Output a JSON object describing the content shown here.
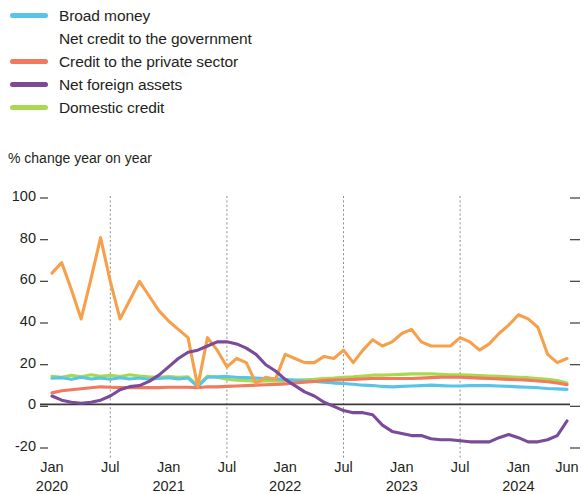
{
  "legend": {
    "items": [
      {
        "label": "Broad money",
        "color": "#58c4e8",
        "key": "broad_money"
      },
      {
        "label": "Net credit to the government",
        "color": "#f6a košt",
        "key": "net_credit_gov"
      },
      {
        "label": "Credit to the private sector",
        "color": "#f0795e",
        "key": "credit_private"
      },
      {
        "label": "Net foreign assets",
        "color": "#7b4a99",
        "key": "net_foreign_assets"
      },
      {
        "label": "Domestic credit",
        "color": "#a9d94e",
        "key": "domestic_credit"
      }
    ]
  },
  "axis_title": "% change year on year",
  "chart_data": {
    "type": "line",
    "title": "",
    "subtitle": "",
    "xlabel": "",
    "ylabel": "% change year on year",
    "ylim": [
      -20,
      100
    ],
    "yticks": [
      100,
      80,
      60,
      40,
      20,
      0,
      -20
    ],
    "ytick_labels": [
      "100",
      "80",
      "60",
      "40",
      "20",
      "0",
      "-20"
    ],
    "grid": "vertical-dashed-at-july",
    "legend_position": "above-plot-left",
    "zero_line": 0,
    "x_start": "2020-01",
    "x_end": "2024-06",
    "x_tick_labels": [
      {
        "month": "Jan",
        "year": "2020",
        "index": 0
      },
      {
        "month": "Jul",
        "year": "",
        "index": 6
      },
      {
        "month": "Jan",
        "year": "2021",
        "index": 12
      },
      {
        "month": "Jul",
        "year": "",
        "index": 18
      },
      {
        "month": "Jan",
        "year": "2022",
        "index": 24
      },
      {
        "month": "Jul",
        "year": "",
        "index": 30
      },
      {
        "month": "Jan",
        "year": "2023",
        "index": 36
      },
      {
        "month": "Jul",
        "year": "",
        "index": 42
      },
      {
        "month": "Jan",
        "year": "2024",
        "index": 48
      },
      {
        "month": "Jun",
        "year": "",
        "index": 53
      }
    ],
    "gridline_indices": [
      6,
      18,
      30,
      42
    ],
    "x_months": [
      "2020-01",
      "2020-02",
      "2020-03",
      "2020-04",
      "2020-05",
      "2020-06",
      "2020-07",
      "2020-08",
      "2020-09",
      "2020-10",
      "2020-11",
      "2020-12",
      "2021-01",
      "2021-02",
      "2021-03",
      "2021-04",
      "2021-05",
      "2021-06",
      "2021-07",
      "2021-08",
      "2021-09",
      "2021-10",
      "2021-11",
      "2021-12",
      "2022-01",
      "2022-02",
      "2022-03",
      "2022-04",
      "2022-05",
      "2022-06",
      "2022-07",
      "2022-08",
      "2022-09",
      "2022-10",
      "2022-11",
      "2022-12",
      "2023-01",
      "2023-02",
      "2023-03",
      "2023-04",
      "2023-05",
      "2023-06",
      "2023-07",
      "2023-08",
      "2023-09",
      "2023-10",
      "2023-11",
      "2023-12",
      "2024-01",
      "2024-02",
      "2024-03",
      "2024-04",
      "2024-05",
      "2024-06"
    ],
    "series": [
      {
        "name": "Broad money",
        "color": "#58c4e8",
        "values": [
          12.5,
          12.8,
          12.0,
          13.0,
          12.2,
          12.6,
          12.0,
          12.8,
          12.2,
          12.6,
          12.0,
          12.4,
          12.8,
          12.2,
          12.6,
          8.5,
          13.0,
          13.2,
          13.4,
          13.0,
          12.8,
          12.6,
          12.4,
          12.2,
          12.0,
          11.6,
          11.2,
          11.0,
          10.6,
          10.2,
          10.0,
          9.6,
          9.2,
          9.0,
          8.6,
          8.4,
          8.6,
          8.8,
          9.0,
          9.2,
          9.0,
          8.8,
          8.8,
          9.0,
          9.0,
          9.0,
          8.8,
          8.6,
          8.4,
          8.2,
          8.0,
          7.6,
          7.4,
          7.2
        ]
      },
      {
        "name": "Net credit to the government",
        "color": "#f6a04b",
        "values": [
          63.0,
          68.0,
          55.0,
          41.0,
          60.0,
          80.0,
          59.0,
          41.0,
          50.0,
          59.0,
          52.0,
          45.0,
          40.0,
          36.0,
          32.0,
          8.5,
          32.0,
          26.0,
          18.0,
          22.0,
          20.0,
          10.0,
          13.0,
          12.0,
          24.0,
          22.0,
          20.0,
          20.0,
          23.0,
          22.0,
          26.0,
          20.0,
          26.0,
          31.0,
          28.0,
          30.0,
          34.0,
          36.0,
          30.0,
          28.0,
          28.0,
          28.0,
          32.0,
          30.0,
          26.0,
          29.0,
          34.0,
          38.0,
          43.0,
          41.0,
          37.0,
          24.0,
          20.0,
          22.0
        ]
      },
      {
        "name": "Credit to the private sector",
        "color": "#f0795e",
        "values": [
          5.5,
          6.5,
          7.0,
          7.5,
          8.0,
          8.4,
          8.2,
          8.0,
          8.0,
          8.0,
          8.0,
          8.0,
          8.2,
          8.2,
          8.2,
          8.0,
          8.4,
          8.4,
          8.6,
          8.8,
          9.0,
          9.2,
          9.4,
          9.6,
          9.8,
          10.2,
          10.6,
          11.0,
          11.4,
          11.6,
          11.8,
          12.0,
          12.2,
          12.4,
          12.4,
          12.4,
          12.4,
          12.4,
          12.6,
          12.8,
          13.0,
          13.0,
          13.0,
          12.8,
          12.6,
          12.4,
          12.2,
          12.0,
          11.8,
          11.6,
          11.2,
          10.8,
          10.2,
          9.4
        ]
      },
      {
        "name": "Net foreign assets",
        "color": "#7b4a99",
        "values": [
          4.0,
          2.0,
          1.0,
          0.5,
          1.0,
          2.0,
          4.0,
          7.0,
          8.5,
          9.0,
          11.0,
          14.0,
          18.0,
          22.0,
          25.0,
          26.0,
          28.0,
          30.0,
          30.0,
          29.0,
          27.0,
          24.0,
          19.0,
          16.0,
          12.0,
          9.0,
          6.0,
          4.0,
          1.0,
          -1.0,
          -3.0,
          -4.0,
          -4.0,
          -5.0,
          -10.0,
          -13.0,
          -14.0,
          -15.0,
          -15.0,
          -16.5,
          -17.0,
          -17.0,
          -17.5,
          -18.0,
          -18.0,
          -18.0,
          -16.0,
          -14.5,
          -16.0,
          -18.0,
          -18.0,
          -17.0,
          -15.0,
          -8.0
        ]
      },
      {
        "name": "Domestic credit",
        "color": "#a9d94e",
        "values": [
          13.5,
          13.0,
          14.0,
          13.2,
          14.2,
          13.5,
          14.0,
          13.4,
          14.2,
          13.6,
          13.2,
          13.0,
          13.4,
          13.0,
          13.2,
          9.0,
          13.6,
          13.0,
          12.0,
          11.6,
          11.4,
          11.0,
          11.2,
          11.2,
          11.4,
          11.6,
          11.8,
          12.0,
          12.4,
          12.6,
          13.0,
          13.2,
          13.6,
          14.0,
          14.0,
          14.2,
          14.4,
          14.6,
          14.6,
          14.6,
          14.4,
          14.2,
          14.2,
          14.0,
          13.8,
          13.6,
          13.4,
          13.2,
          13.0,
          12.8,
          12.4,
          12.0,
          11.4,
          10.2
        ]
      }
    ]
  }
}
